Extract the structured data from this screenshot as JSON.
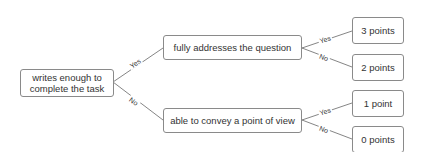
{
  "diagram": {
    "type": "decision-tree",
    "root": {
      "label_line1": "writes enough to",
      "label_line2": "complete the task"
    },
    "level1": [
      {
        "label": "fully addresses the question",
        "edge_label": "Yes"
      },
      {
        "label": "able to convey a point of view",
        "edge_label": "No"
      }
    ],
    "leaves": [
      {
        "label": "3 points",
        "edge_label": "Yes"
      },
      {
        "label": "2 points",
        "edge_label": "No"
      },
      {
        "label": "1 point",
        "edge_label": "Yes"
      },
      {
        "label": "0 points",
        "edge_label": "No"
      }
    ]
  },
  "colors": {
    "border": "#8a8a8a",
    "line": "#666666",
    "text": "#333333",
    "background": "#ffffff"
  }
}
